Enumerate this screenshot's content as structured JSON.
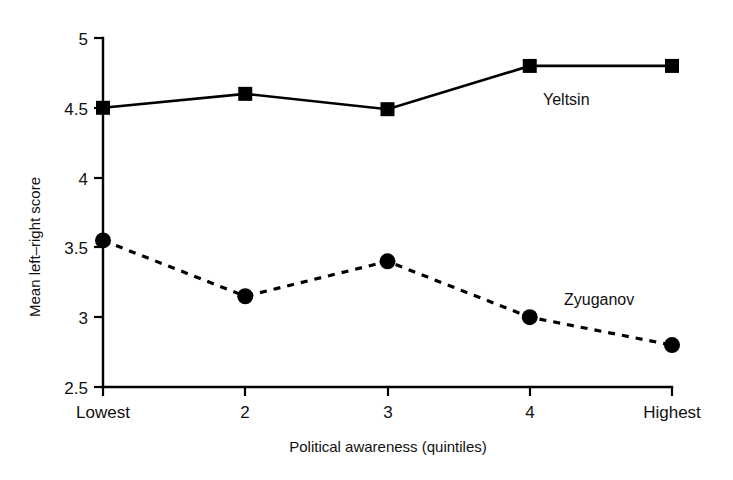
{
  "chart_data": {
    "type": "line",
    "title": "",
    "xlabel": "Political awareness (quintiles)",
    "ylabel": "Mean left–right score",
    "categories": [
      "Lowest",
      "2",
      "3",
      "4",
      "Highest"
    ],
    "xtick_labels": [
      "Lowest",
      "2",
      "3",
      "4",
      "Highest"
    ],
    "ytick_labels": [
      "2.5",
      "3",
      "3.5",
      "4",
      "4.5",
      "5"
    ],
    "ytick_values": [
      2.5,
      3,
      3.5,
      4,
      4.5,
      5
    ],
    "ylim": [
      2.5,
      5
    ],
    "grid": false,
    "legend_position": "inline-annotations",
    "series": [
      {
        "name": "Yeltsin",
        "marker": "square",
        "line_style": "solid",
        "color": "#000000",
        "values": [
          4.5,
          4.6,
          4.49,
          4.8,
          4.8
        ],
        "label_x_category_index": 3,
        "label_value": 4.55
      },
      {
        "name": "Zyuganov",
        "marker": "circle",
        "line_style": "dashed",
        "color": "#000000",
        "values": [
          3.55,
          3.15,
          3.4,
          3.0,
          2.8
        ],
        "label_x_category_index": 3,
        "label_value": 3.13
      }
    ],
    "annotations": [
      {
        "text": "Yeltsin",
        "x_px": 543,
        "y_px": 105
      },
      {
        "text": "Zyuganov",
        "x_px": 564,
        "y_px": 305
      }
    ]
  },
  "axis": {
    "y_title": "Mean left–right score",
    "x_title": "Political awareness (quintiles)"
  }
}
